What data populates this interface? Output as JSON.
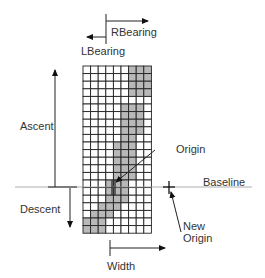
{
  "labels": {
    "rbearing": "RBearing",
    "lbearing": "LBearing",
    "ascent": "Ascent",
    "descent": "Descent",
    "origin": "Origin",
    "baseline": "Baseline",
    "new_origin_line1": "New",
    "new_origin_line2": "Origin",
    "width": "Width"
  },
  "grid": {
    "cols": 9,
    "rows": 22,
    "x": 83,
    "y": 66,
    "cell": 7.6,
    "baseline_row": 16,
    "shade_color": "#b8b8b8",
    "shaded": [
      [
        6,
        7,
        8
      ],
      [
        6,
        7,
        8
      ],
      [
        6,
        7,
        8
      ],
      [
        6,
        7,
        8
      ],
      [],
      [
        5,
        6,
        7
      ],
      [
        5,
        6,
        7
      ],
      [
        5,
        6,
        7
      ],
      [
        5,
        6,
        7
      ],
      [
        5,
        6
      ],
      [
        4,
        5,
        6
      ],
      [
        4,
        5,
        6
      ],
      [
        4,
        5,
        6
      ],
      [
        4,
        5,
        6
      ],
      [
        4,
        5,
        6
      ],
      [
        3,
        4,
        5
      ],
      [
        3,
        4,
        5
      ],
      [
        3,
        4,
        5
      ],
      [
        2,
        3,
        4
      ],
      [
        1,
        2,
        3
      ],
      [
        0,
        1,
        2
      ],
      [
        0,
        1,
        2
      ]
    ]
  }
}
